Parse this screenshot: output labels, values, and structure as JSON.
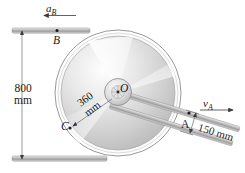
{
  "figure": {
    "background_color": "#ffffff",
    "line_color": "#555555",
    "text_color": "#1a1a1a"
  },
  "labels": {
    "acceleration_b": "a",
    "acceleration_b_sub": "B",
    "velocity_a": "v",
    "velocity_a_sub": "A",
    "point_b": "B",
    "point_o": "O",
    "point_c": "C",
    "point_a": "A"
  },
  "dimensions": {
    "vertical_800_value": "800",
    "vertical_800_unit": "mm",
    "radius_360_value": "360",
    "radius_360_unit": "mm",
    "offset_150": "150 mm"
  },
  "geometry": {
    "wheel_center_x": 118,
    "wheel_center_y": 93,
    "outer_radius": 63,
    "disc_radius": 57,
    "hub_radius": 13
  }
}
